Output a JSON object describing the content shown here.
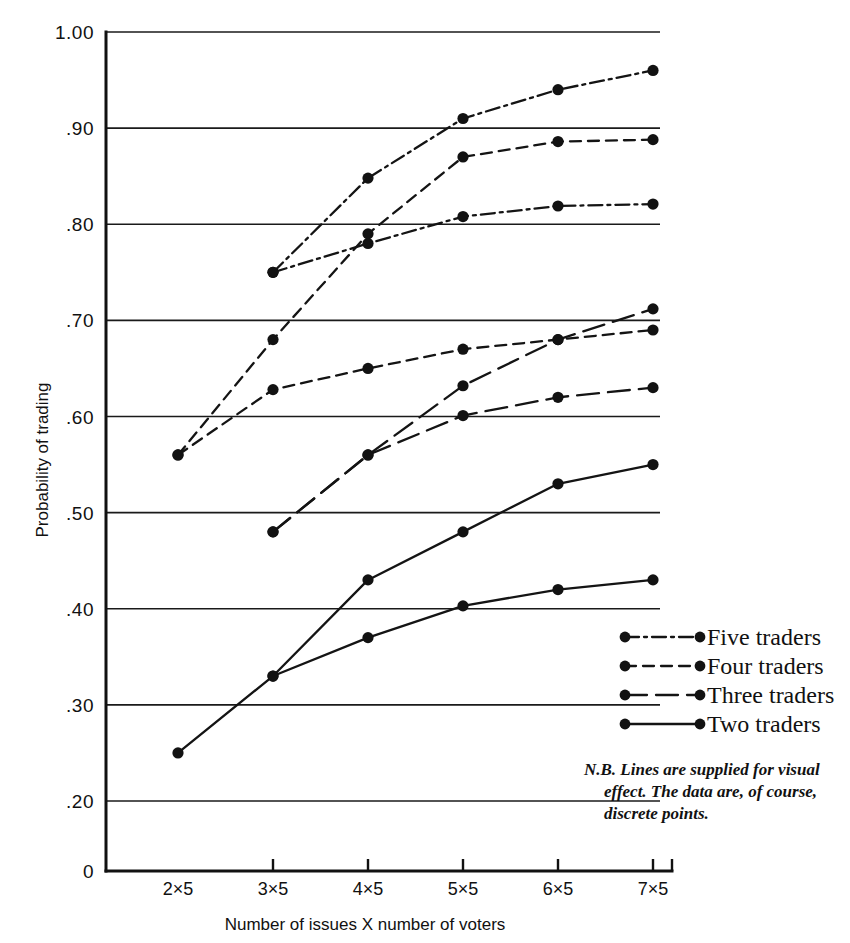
{
  "chart_data": {
    "type": "line",
    "title": "",
    "xlabel": "Number of issues X number of voters",
    "ylabel": "Probability of trading",
    "categories": [
      "2×5",
      "3×5",
      "4×5",
      "5×5",
      "6×5",
      "7×5"
    ],
    "x_tick_labels": [
      "2×5",
      "3×5",
      "4×5",
      "5×5",
      "6×5",
      "7×5"
    ],
    "y_tick_labels": [
      "1.00",
      ".90",
      ".80",
      ".70",
      ".60",
      ".50",
      ".40",
      ".30",
      ".20",
      "0"
    ],
    "y_tick_values": [
      1.0,
      0.9,
      0.8,
      0.7,
      0.6,
      0.5,
      0.4,
      0.3,
      0.2,
      0
    ],
    "ylim": [
      0.2,
      1.0
    ],
    "grid": "horizontal",
    "legend_position": "right-middle",
    "series": [
      {
        "name": "Five traders A",
        "legend_key": "five",
        "dash": "dashdot",
        "x": [
          "3×5",
          "4×5",
          "5×5",
          "6×5",
          "7×5"
        ],
        "values": [
          0.75,
          0.848,
          0.91,
          0.94,
          0.96
        ]
      },
      {
        "name": "Four traders A",
        "legend_key": "four",
        "dash": "dashed",
        "x": [
          "2×5",
          "3×5",
          "4×5",
          "5×5",
          "6×5",
          "7×5"
        ],
        "values": [
          0.56,
          0.68,
          0.79,
          0.87,
          0.886,
          0.888
        ]
      },
      {
        "name": "Five traders B",
        "legend_key": "five",
        "dash": "dashdot",
        "x": [
          "3×5",
          "4×5",
          "5×5",
          "6×5",
          "7×5"
        ],
        "values": [
          0.75,
          0.78,
          0.808,
          0.819,
          0.821
        ]
      },
      {
        "name": "Three traders A",
        "legend_key": "three",
        "dash": "longdash",
        "x": [
          "3×5",
          "4×5",
          "5×5",
          "6×5",
          "7×5"
        ],
        "values": [
          0.48,
          0.56,
          0.601,
          0.62,
          0.63
        ]
      },
      {
        "name": "Four traders B",
        "legend_key": "four",
        "dash": "dashed",
        "x": [
          "2×5",
          "3×5",
          "4×5",
          "5×5",
          "6×5",
          "7×5"
        ],
        "values": [
          0.56,
          0.628,
          0.65,
          0.67,
          0.68,
          0.69
        ]
      },
      {
        "name": "Three traders B",
        "legend_key": "three",
        "dash": "longdash",
        "x": [
          "3×5",
          "4×5",
          "5×5",
          "6×5",
          "7×5"
        ],
        "values": [
          0.48,
          0.56,
          0.632,
          0.68,
          0.712
        ]
      },
      {
        "name": "Two traders A",
        "legend_key": "two",
        "dash": "solid",
        "x": [
          "2×5",
          "3×5",
          "4×5",
          "5×5",
          "6×5",
          "7×5"
        ],
        "values": [
          0.25,
          0.33,
          0.43,
          0.48,
          0.53,
          0.55
        ]
      },
      {
        "name": "Two traders B",
        "legend_key": "two",
        "dash": "solid",
        "x": [
          "3×5",
          "4×5",
          "5×5",
          "6×5",
          "7×5"
        ],
        "values": [
          0.33,
          0.37,
          0.403,
          0.42,
          0.43
        ]
      }
    ],
    "legend": [
      {
        "label": "Five  traders",
        "dash": "dashdot"
      },
      {
        "label": "Four  traders",
        "dash": "dashed"
      },
      {
        "label": "Three traders",
        "dash": "longdash"
      },
      {
        "label": "Two  traders",
        "dash": "solid"
      }
    ],
    "note_lines": [
      "N.B.  Lines are supplied for visual",
      "effect. The data are, of course,",
      "discrete points."
    ],
    "colors": {
      "line": "#141414",
      "grid": "#1a1a1a",
      "axis": "#111111",
      "background": "#ffffff"
    }
  }
}
